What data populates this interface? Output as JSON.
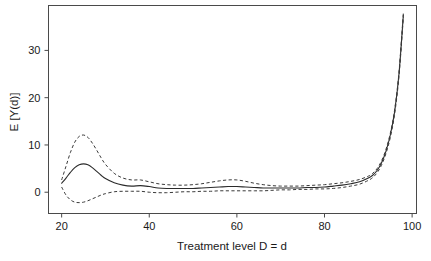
{
  "figure": {
    "background_color": "#ffffff",
    "line_color": "#2b2b2b",
    "frame_color": "#4a4a4a"
  },
  "axes": {
    "x_title": "Treatment level D = d",
    "y_title": "E [Y(d)]",
    "x_ticks": [
      "20",
      "40",
      "60",
      "80",
      "100"
    ],
    "y_ticks": [
      "0",
      "10",
      "20",
      "30"
    ]
  },
  "chart_data": {
    "type": "line",
    "title": "",
    "xlabel": "Treatment level D = d",
    "ylabel": "E [Y(d)]",
    "xlim": [
      17,
      101
    ],
    "ylim": [
      -4.5,
      39.5
    ],
    "grid": false,
    "legend": "none",
    "x_ticks": [
      20,
      40,
      60,
      80,
      100
    ],
    "y_ticks": [
      0,
      10,
      20,
      30
    ],
    "annotations": [
      "Dose-response curve with pointwise confidence band",
      "Early hump near d = 25",
      "Sharp exponential rise after d = 90"
    ],
    "x": [
      20,
      21,
      22,
      23,
      24,
      25,
      26,
      27,
      28,
      29,
      30,
      32,
      34,
      36,
      38,
      40,
      42,
      44,
      46,
      48,
      50,
      52,
      54,
      56,
      58,
      60,
      62,
      64,
      66,
      68,
      70,
      72,
      74,
      76,
      78,
      80,
      82,
      84,
      86,
      88,
      90,
      91,
      92,
      93,
      94,
      95,
      96,
      97,
      98
    ],
    "series": [
      {
        "name": "estimate",
        "style": "solid",
        "values": [
          1.9,
          3.0,
          4.2,
          5.2,
          5.8,
          6.0,
          5.8,
          5.2,
          4.4,
          3.6,
          2.9,
          2.0,
          1.5,
          1.3,
          1.4,
          1.2,
          0.9,
          0.8,
          0.8,
          0.8,
          0.8,
          0.9,
          1.0,
          1.1,
          1.2,
          1.2,
          1.1,
          1.0,
          0.9,
          0.9,
          0.9,
          0.9,
          0.9,
          1.0,
          1.0,
          1.1,
          1.3,
          1.5,
          1.8,
          2.2,
          3.0,
          3.6,
          4.6,
          6.2,
          8.6,
          12.0,
          17.0,
          25.0,
          37.5
        ]
      },
      {
        "name": "upper-confidence-band",
        "style": "dashed",
        "values": [
          2.6,
          5.5,
          8.4,
          10.6,
          11.8,
          12.1,
          11.6,
          10.4,
          8.9,
          7.3,
          5.9,
          4.0,
          3.0,
          2.6,
          2.6,
          2.2,
          1.8,
          1.6,
          1.5,
          1.5,
          1.6,
          1.8,
          2.1,
          2.4,
          2.6,
          2.6,
          2.3,
          1.9,
          1.6,
          1.4,
          1.3,
          1.3,
          1.3,
          1.4,
          1.5,
          1.6,
          1.8,
          2.0,
          2.3,
          2.7,
          3.4,
          4.0,
          5.0,
          6.6,
          9.0,
          12.4,
          17.4,
          25.4,
          38.0
        ]
      },
      {
        "name": "lower-confidence-band",
        "style": "dashed",
        "values": [
          1.1,
          -0.6,
          -1.6,
          -2.1,
          -2.2,
          -2.1,
          -1.8,
          -1.4,
          -1.0,
          -0.6,
          -0.3,
          0.1,
          0.2,
          0.2,
          0.2,
          0.0,
          -0.1,
          -0.1,
          0.0,
          0.1,
          0.1,
          0.2,
          0.2,
          0.3,
          0.3,
          0.3,
          0.3,
          0.3,
          0.3,
          0.4,
          0.5,
          0.5,
          0.6,
          0.6,
          0.7,
          0.7,
          0.8,
          1.0,
          1.3,
          1.7,
          2.5,
          3.1,
          4.1,
          5.7,
          8.1,
          11.5,
          16.5,
          24.5,
          37.0
        ]
      }
    ]
  }
}
